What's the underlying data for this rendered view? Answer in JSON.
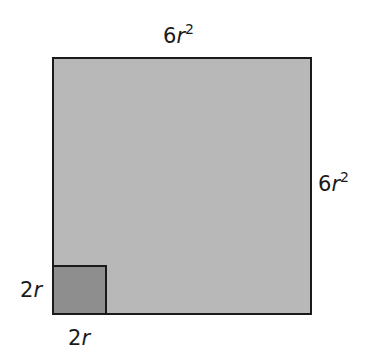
{
  "diagram": {
    "large_square": {
      "top_label": {
        "coef": "6",
        "var": "r",
        "exp": "2"
      },
      "right_label": {
        "coef": "6",
        "var": "r",
        "exp": "2"
      },
      "fill_color": "#b8b8b8"
    },
    "small_square": {
      "left_label": {
        "coef": "2",
        "var": "r"
      },
      "bottom_label": {
        "coef": "2",
        "var": "r"
      },
      "fill_color": "#8e8e8e"
    },
    "stroke_color": "#1a1a1a"
  }
}
